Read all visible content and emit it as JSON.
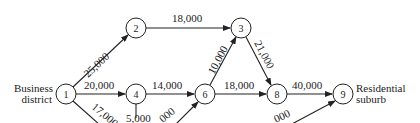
{
  "diagram": {
    "nodes": [
      {
        "id": "1",
        "label": "1",
        "x": 66,
        "y": 94
      },
      {
        "id": "2",
        "label": "2",
        "x": 136,
        "y": 28
      },
      {
        "id": "3",
        "label": "3",
        "x": 241,
        "y": 28
      },
      {
        "id": "4",
        "label": "4",
        "x": 136,
        "y": 94
      },
      {
        "id": "6",
        "label": "6",
        "x": 205,
        "y": 94
      },
      {
        "id": "8",
        "label": "8",
        "x": 277,
        "y": 94
      },
      {
        "id": "9",
        "label": "9",
        "x": 343,
        "y": 94
      }
    ],
    "edges": [
      {
        "from": "1",
        "to": "2",
        "label": "25,000"
      },
      {
        "from": "1",
        "to": "4",
        "label": "20,000"
      },
      {
        "from": "1",
        "to": "offscreen",
        "label": "17,000"
      },
      {
        "from": "2",
        "to": "3",
        "label": "18,000"
      },
      {
        "from": "4",
        "to": "6",
        "label": "14,000"
      },
      {
        "from": "4",
        "to": "offscreen",
        "label": "5,000"
      },
      {
        "from": "offscreen",
        "to": "6",
        "label": "000"
      },
      {
        "from": "6",
        "to": "3",
        "label": "10,000"
      },
      {
        "from": "6",
        "to": "8",
        "label": "18,000"
      },
      {
        "from": "3",
        "to": "8",
        "label": "21,000"
      },
      {
        "from": "8",
        "to": "9",
        "label": "40,000"
      },
      {
        "from": "offscreen",
        "to": "9",
        "label": "000"
      }
    ],
    "source_label": [
      "Business",
      "district"
    ],
    "sink_label": [
      "Residential",
      "suburb"
    ]
  }
}
